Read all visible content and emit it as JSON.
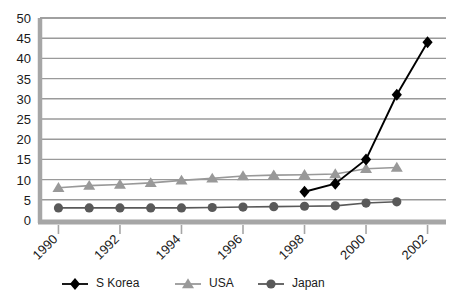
{
  "chart_data": {
    "type": "line",
    "title": "",
    "xlabel": "",
    "ylabel": "",
    "x": [
      1990,
      1991,
      1992,
      1993,
      1994,
      1995,
      1996,
      1997,
      1998,
      1999,
      2000,
      2001,
      2002
    ],
    "xtick_labels": [
      "1990",
      "1992",
      "1994",
      "1996",
      "1998",
      "2000",
      "2002"
    ],
    "xtick_values": [
      1990,
      1992,
      1994,
      1996,
      1998,
      2000,
      2002
    ],
    "ytick_labels": [
      "0",
      "5",
      "10",
      "15",
      "20",
      "25",
      "30",
      "35",
      "40",
      "45",
      "50"
    ],
    "ytick_values": [
      0,
      5,
      10,
      15,
      20,
      25,
      30,
      35,
      40,
      45,
      50
    ],
    "xlim": [
      1989.4,
      2002.6
    ],
    "ylim": [
      0,
      50
    ],
    "grid": "horizontal",
    "legend_position": "bottom",
    "series": [
      {
        "name": "S Korea",
        "marker": "diamond",
        "color": "#000000",
        "x": [
          1998,
          1999,
          2000,
          2001,
          2002
        ],
        "values": [
          7,
          9,
          15,
          31,
          44
        ]
      },
      {
        "name": "USA",
        "marker": "triangle",
        "color": "#999999",
        "x": [
          1990,
          1991,
          1992,
          1993,
          1994,
          1995,
          1996,
          1997,
          1998,
          1999,
          2000,
          2001
        ],
        "values": [
          8,
          8.5,
          8.8,
          9.2,
          9.8,
          10.3,
          10.9,
          11.1,
          11.2,
          11.4,
          12.7,
          13
        ]
      },
      {
        "name": "Japan",
        "marker": "circle",
        "color": "#595959",
        "x": [
          1990,
          1991,
          1992,
          1993,
          1994,
          1995,
          1996,
          1997,
          1998,
          1999,
          2000,
          2001
        ],
        "values": [
          3,
          3,
          3,
          3,
          3,
          3.1,
          3.2,
          3.3,
          3.4,
          3.5,
          4.2,
          4.5
        ]
      }
    ]
  },
  "legend": {
    "items": [
      {
        "label": "S Korea",
        "marker": "diamond",
        "color": "#000000"
      },
      {
        "label": "USA",
        "marker": "triangle",
        "color": "#999999"
      },
      {
        "label": "Japan",
        "marker": "circle",
        "color": "#595959"
      }
    ]
  },
  "colors": {
    "axis": "#a6a6a6",
    "grid": "#9a9a9a",
    "background": "#ffffff",
    "text": "#1a1a1a"
  }
}
